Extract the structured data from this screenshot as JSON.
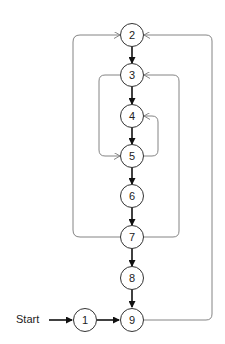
{
  "diagram": {
    "type": "control-flow-graph",
    "start_label": "Start",
    "nodes": [
      {
        "id": "1",
        "label": "1",
        "x": 85,
        "y": 320
      },
      {
        "id": "2",
        "label": "2",
        "x": 132,
        "y": 35
      },
      {
        "id": "3",
        "label": "3",
        "x": 132,
        "y": 75
      },
      {
        "id": "4",
        "label": "4",
        "x": 132,
        "y": 116
      },
      {
        "id": "5",
        "label": "5",
        "x": 132,
        "y": 156
      },
      {
        "id": "6",
        "label": "6",
        "x": 132,
        "y": 196
      },
      {
        "id": "7",
        "label": "7",
        "x": 132,
        "y": 237
      },
      {
        "id": "8",
        "label": "8",
        "x": 132,
        "y": 278
      },
      {
        "id": "9",
        "label": "9",
        "x": 132,
        "y": 320
      }
    ],
    "edges": [
      {
        "from": "Start",
        "to": "1",
        "style": "main"
      },
      {
        "from": "1",
        "to": "9",
        "style": "main"
      },
      {
        "from": "2",
        "to": "3",
        "style": "main"
      },
      {
        "from": "3",
        "to": "4",
        "style": "main"
      },
      {
        "from": "4",
        "to": "5",
        "style": "main"
      },
      {
        "from": "5",
        "to": "6",
        "style": "main"
      },
      {
        "from": "6",
        "to": "7",
        "style": "main"
      },
      {
        "from": "7",
        "to": "8",
        "style": "main"
      },
      {
        "from": "8",
        "to": "9",
        "style": "main"
      },
      {
        "from": "3",
        "to": "5",
        "style": "back",
        "side": "left"
      },
      {
        "from": "5",
        "to": "4",
        "style": "back",
        "side": "right"
      },
      {
        "from": "7",
        "to": "3",
        "style": "back",
        "side": "right"
      },
      {
        "from": "7",
        "to": "2",
        "style": "back",
        "side": "left"
      },
      {
        "from": "9",
        "to": "2",
        "style": "back",
        "side": "right"
      }
    ],
    "colors": {
      "node_stroke": "#333333",
      "main_edge": "#111111",
      "back_edge": "#777777",
      "background": "#ffffff"
    }
  }
}
